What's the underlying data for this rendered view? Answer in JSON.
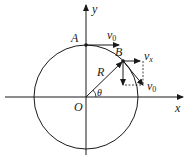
{
  "diagram": {
    "type": "circular motion velocity decomposition",
    "axes": {
      "x_label": "x",
      "y_label": "y",
      "origin_label": "O"
    },
    "circle": {
      "radius_label": "R"
    },
    "points": [
      {
        "label": "A",
        "velocity_label": "v",
        "velocity_sub": "0"
      },
      {
        "label": "B"
      }
    ],
    "angle_label": "θ",
    "vectors": {
      "vx_main": "v",
      "vx_sub": "x",
      "v0_main": "v",
      "v0_sub": "0"
    },
    "colors": {
      "stroke": "#1a1a1a",
      "background": "#ffffff"
    }
  }
}
